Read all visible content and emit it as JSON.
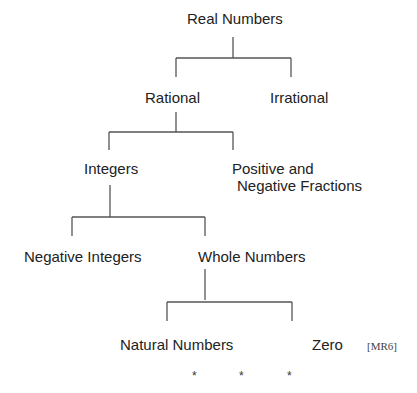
{
  "diagram": {
    "title": "Real Numbers",
    "nodes": {
      "real": "Real Numbers",
      "rational": "Rational",
      "irrational": "Irrational",
      "integers": "Integers",
      "fractions_line1": "Positive and",
      "fractions_line2": "Negative Fractions",
      "negative_integers": "Negative Integers",
      "whole": "Whole Numbers",
      "natural": "Natural Numbers",
      "zero": "Zero"
    },
    "reference": "[MR6]",
    "asterisks": [
      "*",
      "*",
      "*"
    ]
  }
}
